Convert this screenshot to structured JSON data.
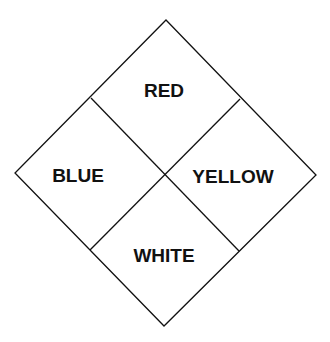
{
  "diagram": {
    "type": "hazard-diamond",
    "quadrants": {
      "top": {
        "label": "RED"
      },
      "left": {
        "label": "BLUE"
      },
      "right": {
        "label": "YELLOW"
      },
      "bottom": {
        "label": "WHITE"
      }
    },
    "colors": {
      "line": "#111111",
      "background": "#ffffff",
      "text": "#111111"
    }
  }
}
